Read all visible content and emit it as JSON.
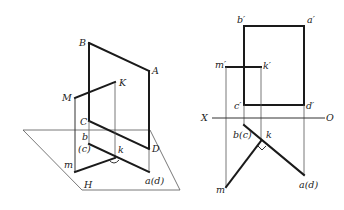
{
  "left_figure": {
    "labels": {
      "B": "B",
      "A": "A",
      "K": "K",
      "M": "M",
      "C": "C",
      "b": "b",
      "c": "(c)",
      "k": "k",
      "D": "D",
      "m": "m",
      "ad": "a(d)",
      "H": "H"
    }
  },
  "right_figure": {
    "labels": {
      "b_prime": "b′",
      "a_prime": "a′",
      "m_prime": "m′",
      "k_prime": "k′",
      "c_prime": "c′",
      "d_prime": "d′",
      "X": "X",
      "O": "O",
      "bc": "b(c)",
      "k": "k",
      "m": "m",
      "ad": "a(d)"
    }
  },
  "colors": {
    "line": "#1a1a1a",
    "thin_line": "#555555",
    "background": "#ffffff"
  }
}
